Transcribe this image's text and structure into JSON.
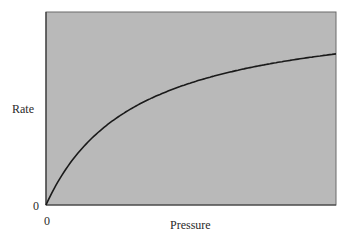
{
  "chart_data": {
    "type": "line",
    "title": "",
    "xlabel": "Pressure",
    "ylabel": "Rate",
    "x_tick_labels": [
      "0"
    ],
    "y_tick_labels": [
      "0"
    ],
    "grid": false,
    "legend": null,
    "background_color": "#b8b8b8",
    "line_color": "#1a1a1a",
    "xlim": [
      0,
      290
    ],
    "ylim": [
      0,
      193
    ],
    "series": [
      {
        "name": "Rate vs Pressure (saturation curve)",
        "model": "hyperbolic: rate = Vmax * P / (K + P)",
        "Vmax": 198,
        "K": 90,
        "x": [
          0,
          5,
          10,
          20,
          30,
          45,
          60,
          80,
          100,
          130,
          160,
          200,
          240,
          290
        ],
        "values": [
          0,
          10.4,
          19.8,
          36.0,
          49.5,
          66.0,
          79.2,
          93.2,
          104.2,
          117.0,
          126.7,
          136.6,
          144.0,
          151.1
        ]
      }
    ]
  },
  "labels": {
    "ylabel": "Rate",
    "xlabel": "Pressure",
    "y_origin": "0",
    "x_origin": "0"
  }
}
